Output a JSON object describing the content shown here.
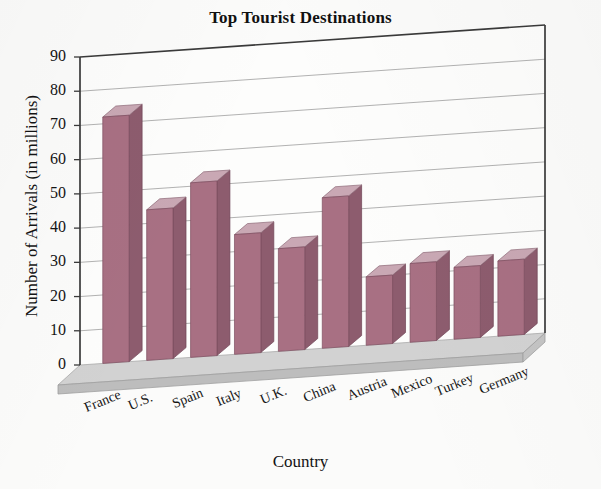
{
  "chart_data": {
    "type": "bar",
    "title": "Top Tourist Destinations",
    "xlabel": "Country",
    "ylabel": "Number of Arrivals (in millions)",
    "categories": [
      "France",
      "U.S.",
      "Spain",
      "Italy",
      "U.K.",
      "China",
      "Austria",
      "Mexico",
      "Turkey",
      "Germany"
    ],
    "values": [
      72,
      44,
      51,
      35,
      30,
      44,
      20,
      23,
      21,
      22
    ],
    "ylim": [
      0,
      90
    ],
    "yticks": [
      0,
      10,
      20,
      30,
      40,
      50,
      60,
      70,
      80,
      90
    ],
    "ytick_labels": [
      "0",
      "10",
      "20",
      "30",
      "40",
      "50",
      "60",
      "70",
      "80",
      "90"
    ],
    "grid": true,
    "grid_axis": "y",
    "legend": false,
    "style": "3d-column",
    "bar_color_front": "#a87083",
    "bar_color_top": "#c9a8b4",
    "bar_color_side": "#8d5c6e",
    "floor_color": "#c6c6c6",
    "plot_background": "#fdfdfc",
    "axis_color": "#3a3a3a",
    "grid_color": "#9a9a9a"
  }
}
